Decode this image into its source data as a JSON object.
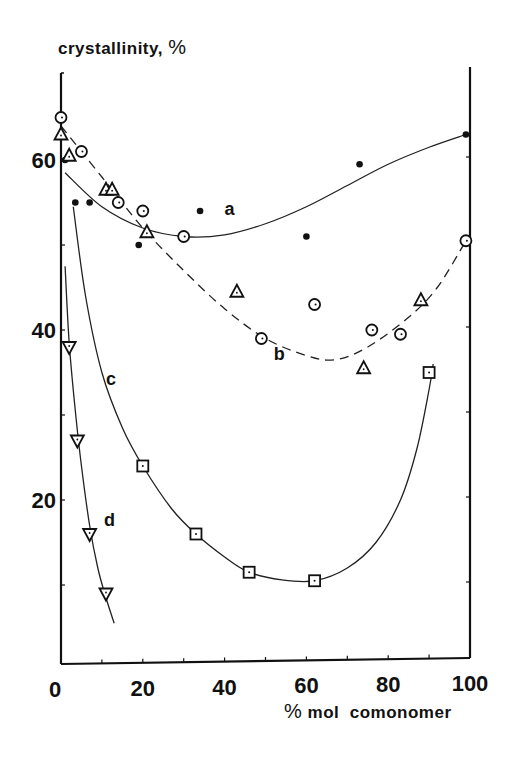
{
  "chart_data": {
    "type": "scatter",
    "title": "",
    "ylabel": "crystallinity, %",
    "xlabel": "% mol comonomer",
    "xlim": [
      0,
      100
    ],
    "ylim": [
      0,
      70
    ],
    "xticks": [
      0,
      20,
      40,
      60,
      80,
      100
    ],
    "yticks": [
      20,
      40,
      60
    ],
    "grid": false,
    "legend": "none (curves labeled inline a, b, c, d)",
    "series": [
      {
        "name": "a",
        "marker": "filled-circle",
        "line": "solid",
        "points": [
          [
            1,
            60
          ],
          [
            3.5,
            55
          ],
          [
            7,
            55
          ],
          [
            19,
            50
          ],
          [
            34,
            54
          ],
          [
            60,
            51
          ],
          [
            73,
            59.5
          ],
          [
            99,
            63
          ]
        ],
        "curve": [
          [
            1,
            58.5
          ],
          [
            10,
            54.5
          ],
          [
            20,
            52
          ],
          [
            30,
            51
          ],
          [
            40,
            51.2
          ],
          [
            50,
            52.5
          ],
          [
            60,
            54.5
          ],
          [
            70,
            57
          ],
          [
            80,
            59.5
          ],
          [
            90,
            61.5
          ],
          [
            99,
            63
          ]
        ]
      },
      {
        "name": "b",
        "marker": "open-circle",
        "line": "dashed",
        "points": [
          [
            0,
            65
          ],
          [
            5,
            61
          ],
          [
            14,
            55
          ],
          [
            20,
            54
          ],
          [
            30,
            51
          ],
          [
            49,
            39
          ],
          [
            62,
            43
          ],
          [
            76,
            40
          ],
          [
            83,
            39.5
          ],
          [
            99,
            50.5
          ]
        ],
        "curve": [
          [
            0,
            64
          ],
          [
            10,
            58
          ],
          [
            20,
            52
          ],
          [
            30,
            47
          ],
          [
            40,
            42.5
          ],
          [
            50,
            39
          ],
          [
            60,
            37
          ],
          [
            67,
            36.5
          ],
          [
            75,
            38
          ],
          [
            85,
            41.5
          ],
          [
            92,
            45
          ],
          [
            99,
            50.5
          ]
        ]
      },
      {
        "name": "b",
        "marker": "open-triangle",
        "line": "dashed",
        "points": [
          [
            0,
            63
          ],
          [
            2,
            60.5
          ],
          [
            11,
            56.5
          ],
          [
            12.5,
            56.5
          ],
          [
            21,
            51.5
          ],
          [
            43,
            44.5
          ],
          [
            74,
            35.5
          ],
          [
            88,
            43.5
          ]
        ]
      },
      {
        "name": "c",
        "marker": "open-square",
        "line": "solid",
        "points": [
          [
            20,
            24
          ],
          [
            33,
            16
          ],
          [
            46,
            11.5
          ],
          [
            62,
            10.5
          ],
          [
            90,
            35
          ]
        ],
        "curve": [
          [
            3,
            54.5
          ],
          [
            6,
            44
          ],
          [
            10,
            35
          ],
          [
            15,
            28.5
          ],
          [
            20,
            24
          ],
          [
            27,
            19
          ],
          [
            33,
            16
          ],
          [
            40,
            13.3
          ],
          [
            46,
            11.5
          ],
          [
            54,
            10.6
          ],
          [
            62,
            10.5
          ],
          [
            70,
            12
          ],
          [
            77,
            15
          ],
          [
            83,
            20
          ],
          [
            87,
            26
          ],
          [
            90,
            33
          ],
          [
            91,
            36
          ]
        ]
      },
      {
        "name": "d",
        "marker": "open-inverted-triangle",
        "line": "solid",
        "points": [
          [
            2,
            38
          ],
          [
            4,
            27
          ],
          [
            7,
            16
          ],
          [
            11,
            9
          ]
        ],
        "curve": [
          [
            1,
            47.5
          ],
          [
            2,
            38.5
          ],
          [
            3.5,
            30.5
          ],
          [
            5,
            24
          ],
          [
            7,
            17
          ],
          [
            9,
            12
          ],
          [
            11,
            8.5
          ],
          [
            13,
            5.5
          ]
        ]
      }
    ],
    "annotations": [
      {
        "text": "a",
        "x": 40,
        "y": 53.5
      },
      {
        "text": "b",
        "x": 52,
        "y": 36.5
      },
      {
        "text": "c",
        "x": 11,
        "y": 33.5
      },
      {
        "text": "d",
        "x": 10.5,
        "y": 17
      }
    ]
  },
  "axes": {
    "y_title": "crystallinity,",
    "y_title_unit": "%",
    "x_title_unit": "%",
    "x_title": "mol  comonomer"
  }
}
